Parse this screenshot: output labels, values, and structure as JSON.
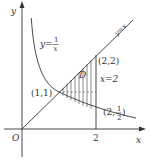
{
  "diagram": {
    "axes": {
      "x_label": "x",
      "y_label": "y",
      "origin_label": "O",
      "x_tick_label": "2"
    },
    "curves": {
      "hyperbola_label_lhs": "y=",
      "hyperbola_label_num": "1",
      "hyperbola_label_den": "x",
      "line_label": "y=x",
      "vertical_line_label": "x=2"
    },
    "points": {
      "p11": "(1,1)",
      "p22": "(2,2)",
      "p2half_prefix": "(2,",
      "p2half_num": "1",
      "p2half_den": "2",
      "p2half_suffix": ")"
    },
    "region_label": "D",
    "colors": {
      "ink": "#333333",
      "background": "#ffffff"
    }
  }
}
